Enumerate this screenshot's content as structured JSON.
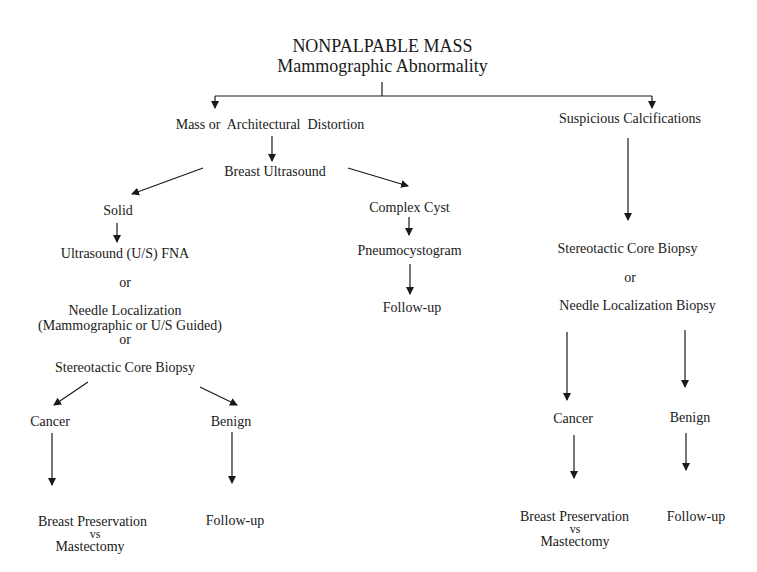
{
  "title": {
    "line1": "NONPALPABLE MASS",
    "line2": "Mammographic Abnormality"
  },
  "left_branch": {
    "label": "Mass or  Architectural  Distortion",
    "ultrasound": "Breast Ultrasound",
    "solid": {
      "label": "Solid",
      "option1": "Ultrasound (U/S) FNA",
      "or1": "or",
      "option2_line1": "Needle Localization",
      "option2_line2": "(Mammographic or U/S Guided)",
      "or2": "or",
      "option3": "Stereotactic Core Biopsy",
      "cancer": "Cancer",
      "benign": "Benign",
      "cancer_outcome_line1": "Breast Preservation",
      "cancer_outcome_vs": "vs",
      "cancer_outcome_line2": "Mastectomy",
      "benign_outcome": "Follow-up"
    },
    "cyst": {
      "label": "Complex Cyst",
      "procedure": "Pneumocystogram",
      "outcome": "Follow-up"
    }
  },
  "right_branch": {
    "label": "Suspicious Calcifications",
    "option1": "Stereotactic Core Biopsy",
    "or": "or",
    "option2": "Needle Localization Biopsy",
    "cancer": "Cancer",
    "benign": "Benign",
    "cancer_outcome_line1": "Breast Preservation",
    "cancer_outcome_vs": "vs",
    "cancer_outcome_line2": "Mastectomy",
    "benign_outcome": "Follow-up"
  },
  "colors": {
    "line": "#1a1a1a",
    "background": "#ffffff"
  }
}
